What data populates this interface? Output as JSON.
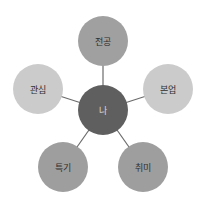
{
  "diagram": {
    "type": "radial-mind-map",
    "center": {
      "label": "나",
      "fill": "#5f5f5f",
      "text_color": "#d8d8d8"
    },
    "connector_color": "#6b6b6b",
    "nodes": [
      {
        "id": "major",
        "label": "전공",
        "fill": "#a0a0a0",
        "text_color": "#2e2e2e"
      },
      {
        "id": "main-job",
        "label": "본업",
        "fill": "#cbcbcb",
        "text_color": "#2e2e2e"
      },
      {
        "id": "hobby",
        "label": "취미",
        "fill": "#9e9e9e",
        "text_color": "#2e2e2e"
      },
      {
        "id": "skill",
        "label": "특기",
        "fill": "#9e9e9e",
        "text_color": "#2e2e2e"
      },
      {
        "id": "interest",
        "label": "관심",
        "fill": "#cbcbcb",
        "text_color": "#2e2e2e"
      }
    ]
  }
}
